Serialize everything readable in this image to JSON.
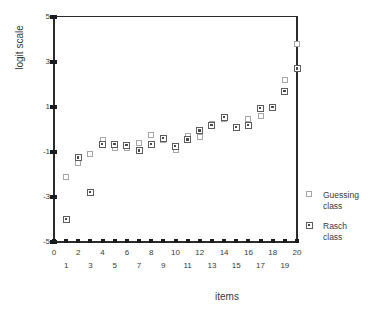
{
  "chart_data": {
    "type": "scatter",
    "title": "",
    "xlabel": "items",
    "ylabel": "logit scale",
    "xlim": [
      0,
      20
    ],
    "ylim": [
      -5,
      5
    ],
    "ytick_labels": [
      "5",
      "3",
      "1",
      "-1",
      "-3",
      "-5"
    ],
    "ytick_values": [
      5,
      3,
      1,
      -1,
      -3,
      -5
    ],
    "xtick_labels": [
      "0",
      "1",
      "2",
      "3",
      "4",
      "5",
      "6",
      "7",
      "8",
      "9",
      "10",
      "11",
      "12",
      "13",
      "14",
      "15",
      "16",
      "17",
      "18",
      "19",
      "20"
    ],
    "xtick_values": [
      0,
      1,
      2,
      3,
      4,
      5,
      6,
      7,
      8,
      9,
      10,
      11,
      12,
      13,
      14,
      15,
      16,
      17,
      18,
      19,
      20
    ],
    "grid": false,
    "legend_position": "right",
    "x": [
      1,
      2,
      3,
      4,
      5,
      6,
      7,
      8,
      9,
      10,
      11,
      12,
      13,
      14,
      15,
      16,
      17,
      18,
      19,
      20
    ],
    "series": [
      {
        "name": "Guessing class",
        "marker": "open-square",
        "color": "#a6a6a6",
        "values": [
          -2.1,
          -1.5,
          -1.1,
          -0.45,
          -0.8,
          -0.8,
          -0.6,
          -0.25,
          -0.45,
          -0.9,
          -0.3,
          -0.35,
          0.25,
          0.45,
          0.05,
          0.45,
          0.6,
          1.0,
          2.2,
          3.8
        ]
      },
      {
        "name": "Rasch class",
        "marker": "dotted-square",
        "color": "#5c5c5c",
        "values": [
          -4.0,
          -1.25,
          -2.8,
          -0.65,
          -0.65,
          -0.7,
          -0.95,
          -0.65,
          -0.4,
          -0.75,
          -0.45,
          -0.05,
          0.2,
          0.55,
          0.1,
          0.2,
          0.95,
          1.0,
          1.7,
          2.7
        ]
      }
    ]
  },
  "legend": {
    "items": [
      {
        "line1": "Guessing",
        "line2": "class",
        "key": "guessing"
      },
      {
        "line1": "Rasch",
        "line2": "class",
        "key": "rasch"
      }
    ]
  }
}
